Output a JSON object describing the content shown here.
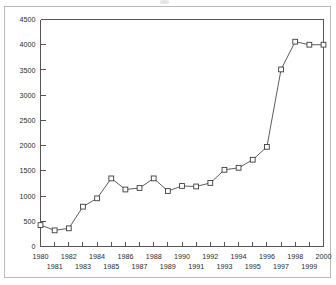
{
  "figure": {
    "frame_color": "#b9b9b9",
    "background": "#ffffff",
    "axis_color": "#555555",
    "line_color": "#4a4a4a",
    "marker_fill": "#ffffff"
  },
  "chart_data": {
    "type": "line",
    "title": "",
    "subtitle": "",
    "xlabel": "",
    "ylabel": "",
    "x": [
      1980,
      1981,
      1982,
      1983,
      1984,
      1985,
      1986,
      1987,
      1988,
      1989,
      1990,
      1991,
      1992,
      1993,
      1994,
      1995,
      1996,
      1997,
      1998,
      1999,
      2000
    ],
    "values": [
      425,
      320,
      360,
      790,
      955,
      1350,
      1130,
      1160,
      1350,
      1100,
      1200,
      1190,
      1260,
      1520,
      1560,
      1720,
      1975,
      3510,
      4060,
      4000,
      4000
    ],
    "series": [
      {
        "name": "series-1",
        "values": [
          425,
          320,
          360,
          790,
          955,
          1350,
          1130,
          1160,
          1350,
          1100,
          1200,
          1190,
          1260,
          1520,
          1560,
          1720,
          1975,
          3510,
          4060,
          4000,
          4000
        ],
        "marker": "open-square",
        "line_style": "solid"
      }
    ],
    "ylim": [
      0,
      4500
    ],
    "xlim": [
      1980,
      2000
    ],
    "ytick_values": [
      0,
      500,
      1000,
      1500,
      2000,
      2500,
      3000,
      3500,
      4000,
      4500
    ],
    "ytick_labels": [
      "0",
      "500",
      "1000",
      "1500",
      "2000",
      "2500",
      "3000",
      "3500",
      "4000",
      "4500"
    ],
    "xtick_values": [
      1980,
      1981,
      1982,
      1983,
      1984,
      1985,
      1986,
      1987,
      1988,
      1989,
      1990,
      1991,
      1992,
      1993,
      1994,
      1995,
      1996,
      1997,
      1998,
      1999,
      2000
    ],
    "xtick_labels": [
      "1980",
      "1981",
      "1982",
      "1983",
      "1984",
      "1985",
      "1986",
      "1987",
      "1988",
      "1989",
      "1990",
      "1991",
      "1992",
      "1993",
      "1994",
      "1995",
      "1996",
      "1997",
      "1998",
      "1999",
      "2000"
    ],
    "xtick_label_rows": 2,
    "xtick_row_assignment": [
      0,
      1,
      0,
      1,
      0,
      1,
      0,
      1,
      0,
      1,
      0,
      1,
      0,
      1,
      0,
      1,
      0,
      1,
      0,
      1,
      0
    ],
    "grid": false,
    "legend": null,
    "legend_position": "none",
    "annotations": []
  }
}
